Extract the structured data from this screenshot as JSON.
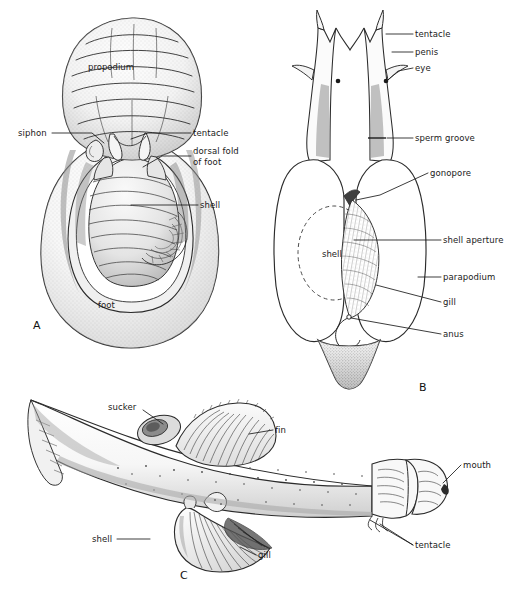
{
  "figure": {
    "background_color": "#ffffff",
    "ink_color": "#1a1a1a",
    "width": 518,
    "height": 603
  },
  "panels": [
    {
      "id": "A",
      "letter": "A",
      "letter_pos": {
        "x": 33,
        "y": 319
      },
      "description": "Ventral view of a shelled pteropod with broad foot and coiled shell",
      "inner_labels": [
        {
          "name": "propodium",
          "text": "propodium",
          "x": 88,
          "y": 67
        },
        {
          "name": "foot",
          "text": "foot",
          "x": 98,
          "y": 305
        }
      ],
      "callouts": [
        {
          "name": "siphon",
          "text": "siphon",
          "text_x": 18,
          "text_y": 128,
          "anchor": "right",
          "leader": "M 52,133 L 92,133 L 104,143"
        },
        {
          "name": "tentacle",
          "text": "tentacle",
          "text_x": 193,
          "text_y": 128,
          "anchor": "left",
          "leader": "M 191,133 L 148,133 L 131,139"
        },
        {
          "name": "dorsal-fold-of-foot",
          "text": "dorsal fold\nof foot",
          "text_x": 193,
          "text_y": 150,
          "anchor": "left",
          "leader": "M 191,156 L 160,156 L 141,166"
        },
        {
          "name": "shell",
          "text": "shell",
          "text_x": 200,
          "text_y": 200,
          "anchor": "left",
          "leader": "M 198,205 L 131,205"
        }
      ]
    },
    {
      "id": "B",
      "letter": "B",
      "letter_pos": {
        "x": 419,
        "y": 381
      },
      "description": "Dorsal view of a pteropod showing head appendages, parapodia and shell outline",
      "inner_labels": [
        {
          "name": "shell",
          "text": "shell",
          "x": 328,
          "y": 254
        }
      ],
      "callouts": [
        {
          "name": "tentacle",
          "text": "tentacle",
          "text_x": 415,
          "text_y": 29,
          "anchor": "left",
          "leader": "M 413,34 L 386,34"
        },
        {
          "name": "penis",
          "text": "penis",
          "text_x": 415,
          "text_y": 47,
          "anchor": "left",
          "leader": "M 413,52 L 389,52"
        },
        {
          "name": "eye",
          "text": "eye",
          "text_x": 415,
          "text_y": 63,
          "anchor": "left",
          "leader": "M 413,68 L 396,72 L 385,81"
        },
        {
          "name": "sperm-groove",
          "text": "sperm groove",
          "text_x": 415,
          "text_y": 133,
          "anchor": "left",
          "leader": "M 413,138 L 385,138"
        },
        {
          "name": "gonopore",
          "text": "gonopore",
          "text_x": 430,
          "text_y": 168,
          "anchor": "left",
          "leader": "M 428,173 L 380,196 L 357,200"
        },
        {
          "name": "shell-aperture",
          "text": "shell aperture",
          "text_x": 443,
          "text_y": 235,
          "anchor": "left",
          "leader": "M 441,240 L 352,240"
        },
        {
          "name": "parapodium",
          "text": "parapodium",
          "text_x": 443,
          "text_y": 272,
          "anchor": "left",
          "leader": "M 441,277 L 418,277"
        },
        {
          "name": "gill",
          "text": "gill",
          "text_x": 443,
          "text_y": 297,
          "anchor": "left",
          "leader": "M 441,302 L 376,285"
        },
        {
          "name": "anus",
          "text": "anus",
          "text_x": 443,
          "text_y": 329,
          "anchor": "left",
          "leader": "M 441,334 L 348,318"
        }
      ]
    },
    {
      "id": "C",
      "letter": "C",
      "letter_pos": {
        "x": 180,
        "y": 569
      },
      "description": "Lateral view of an elongate cephalaspidean slug with sucker, fin, shell, gill and head tentacles",
      "inner_labels": [],
      "callouts": [
        {
          "name": "sucker",
          "text": "sucker",
          "text_x": 108,
          "text_y": 402,
          "anchor": "right",
          "leader": "M 143,411 L 164,424"
        },
        {
          "name": "fin",
          "text": "fin",
          "text_x": 275,
          "text_y": 425,
          "anchor": "left",
          "leader": "M 273,430 L 248,433"
        },
        {
          "name": "shell",
          "text": "shell",
          "text_x": 92,
          "text_y": 534,
          "anchor": "right",
          "leader": "M 117,539 L 148,539"
        },
        {
          "name": "gill",
          "text": "gill",
          "text_x": 258,
          "text_y": 550,
          "anchor": "left",
          "leader": "M 256,555 L 238,546"
        },
        {
          "name": "mouth",
          "text": "mouth",
          "text_x": 463,
          "text_y": 460,
          "anchor": "left",
          "leader": "M 461,465 L 441,483"
        },
        {
          "name": "tentacle",
          "text": "tentacle",
          "text_x": 415,
          "text_y": 540,
          "anchor": "left",
          "leader": "M 413,545 L 382,524 M 413,545 L 372,519"
        }
      ]
    }
  ]
}
